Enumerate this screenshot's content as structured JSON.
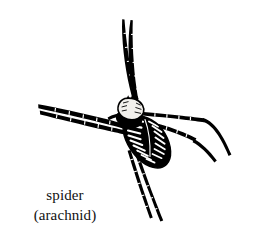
{
  "figure": {
    "subject": "spider",
    "style": "black-and-white engraved line illustration",
    "background_color": "#ffffff",
    "ink_color": "#000000"
  },
  "caption": {
    "common_name": "spider",
    "classification": "(arachnid)",
    "text_color": "#111111"
  },
  "illustration": {
    "title": "spider-line-art",
    "body": {
      "cephalothorax_label": "cephalothorax",
      "cephalothorax_fill": "#f2f0ec",
      "abdomen_label": "abdomen",
      "abdomen_fill": "#000000",
      "abdomen_marking": "white chevron herringbone bands"
    },
    "legs": [
      {
        "name": "leg-upper-left",
        "direction": "up"
      },
      {
        "name": "leg-upper-right",
        "direction": "up"
      },
      {
        "name": "leg-left-upper",
        "direction": "left"
      },
      {
        "name": "leg-left-lower",
        "direction": "left"
      },
      {
        "name": "leg-right-upper",
        "direction": "right"
      },
      {
        "name": "leg-right-lower",
        "direction": "right"
      },
      {
        "name": "leg-lower-left",
        "direction": "down"
      },
      {
        "name": "leg-lower-right",
        "direction": "down"
      }
    ]
  }
}
